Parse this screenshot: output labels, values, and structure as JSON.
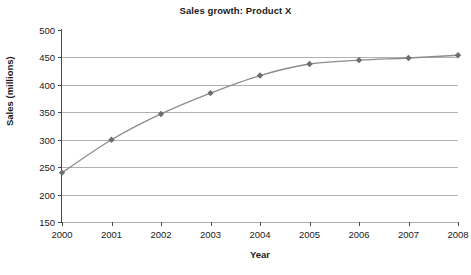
{
  "chart_data": {
    "type": "line",
    "title": "Sales growth: Product X",
    "xlabel": "Year",
    "ylabel": "Sales (millions)",
    "x": [
      2000,
      2001,
      2002,
      2003,
      2004,
      2005,
      2006,
      2007,
      2008
    ],
    "categories": [
      "2000",
      "2001",
      "2002",
      "2003",
      "2004",
      "2005",
      "2006",
      "2007",
      "2008"
    ],
    "values": [
      240,
      300,
      347,
      385,
      417,
      438,
      445,
      449,
      454
    ],
    "series": [
      {
        "name": "Product X",
        "values": [
          240,
          300,
          347,
          385,
          417,
          438,
          445,
          449,
          454
        ]
      }
    ],
    "ylim": [
      150,
      500
    ],
    "xlim": [
      2000,
      2008
    ],
    "yticks": [
      150,
      200,
      250,
      300,
      350,
      400,
      450,
      500
    ],
    "ytick_labels": [
      "150",
      "200",
      "250",
      "300",
      "350",
      "400",
      "450",
      "500"
    ],
    "xticks": [
      2000,
      2001,
      2002,
      2003,
      2004,
      2005,
      2006,
      2007,
      2008
    ],
    "xtick_labels": [
      "2000",
      "2001",
      "2002",
      "2003",
      "2004",
      "2005",
      "2006",
      "2007",
      "2008"
    ],
    "grid": "horizontal",
    "legend": "none",
    "marker": "diamond",
    "colors": {
      "line": "#8c8c8c",
      "marker": "#6e6e6e",
      "gridline": "#b0b0b0",
      "axis": "#4a4a4a",
      "text": "#1a1a1a",
      "background": "#ffffff"
    }
  }
}
